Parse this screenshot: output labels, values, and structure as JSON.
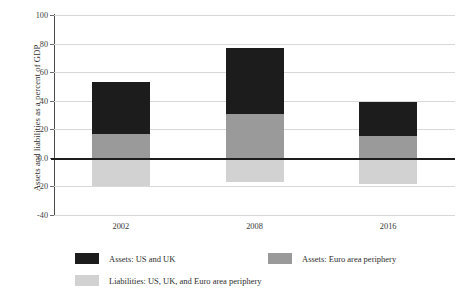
{
  "chart_data": {
    "type": "bar",
    "stacked": true,
    "title": "",
    "xlabel": "",
    "ylabel": "Assets and liabilities as a percent of GDP",
    "categories": [
      "2002",
      "2008",
      "2016"
    ],
    "ylim": [
      -40,
      100
    ],
    "yticks": [
      "100",
      "80",
      "60",
      "40",
      "20",
      "0.0",
      "-20",
      "-40"
    ],
    "ytick_values": [
      100,
      80,
      60,
      40,
      20,
      0,
      -20,
      -40
    ],
    "grid": true,
    "legend_position": "bottom",
    "zero_line": true,
    "series": [
      {
        "name": "Assets: US and UK",
        "color": "#1c1c1c",
        "values": [
          36,
          46,
          24
        ],
        "stack_base": [
          17,
          31,
          15
        ],
        "stack_top": [
          53,
          77,
          39
        ]
      },
      {
        "name": "Assets: Euro area periphery",
        "color": "#9a9a9a",
        "values": [
          17,
          31,
          15
        ],
        "stack_base": [
          0,
          0,
          0
        ],
        "stack_top": [
          17,
          31,
          15
        ]
      },
      {
        "name": "Liabilities: US, UK, and Euro area periphery",
        "color": "#d2d2d2",
        "values": [
          -20,
          -17,
          -18
        ],
        "stack_base": [
          0,
          0,
          0
        ],
        "stack_top": [
          -20,
          -17,
          -18
        ]
      }
    ]
  },
  "legend": {
    "items": [
      {
        "label": "Assets: US and UK",
        "color": "#1c1c1c"
      },
      {
        "label": "Assets: Euro area periphery",
        "color": "#9a9a9a"
      },
      {
        "label": "Liabilities: US, UK, and Euro area periphery",
        "color": "#d2d2d2"
      }
    ]
  }
}
